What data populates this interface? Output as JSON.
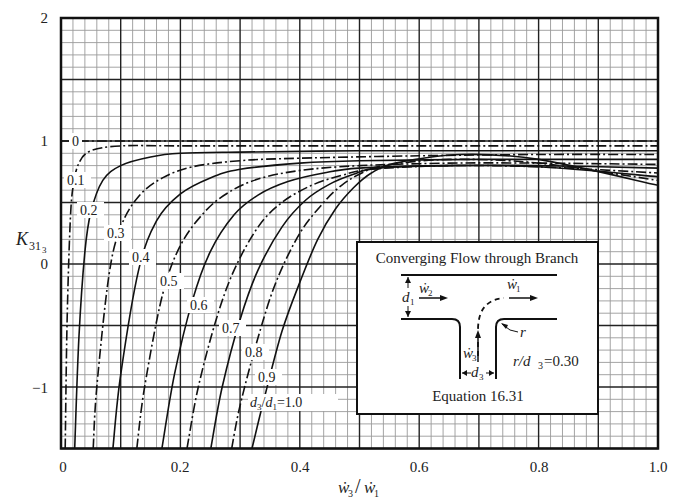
{
  "chart_data": {
    "type": "line",
    "title": "",
    "xlabel": "ẇ3 / ẇ1",
    "ylabel": "K31₃",
    "xlim": [
      0,
      1.0
    ],
    "ylim": [
      -1.5,
      2
    ],
    "grid": true,
    "xticks": [
      "0",
      "0.2",
      "0.4",
      "0.6",
      "0.8",
      "1.0"
    ],
    "yticks": [
      "2",
      "1",
      "0",
      "−1"
    ],
    "legend_position": "none (curves labeled inline)",
    "series": [
      {
        "name": "0",
        "style": "dash-dot",
        "x": [
          0.0,
          1.0
        ],
        "y": [
          1.0,
          1.0
        ]
      },
      {
        "name": "0.1",
        "style": "dash-dot",
        "x": [
          0.007,
          0.01,
          0.015,
          0.02,
          0.03,
          0.05,
          0.1,
          0.2,
          0.4,
          0.6,
          0.8,
          1.0
        ],
        "y": [
          -1.5,
          -0.5,
          0.3,
          0.62,
          0.82,
          0.92,
          0.96,
          0.96,
          0.96,
          0.96,
          0.96,
          0.96
        ]
      },
      {
        "name": "0.2",
        "style": "solid",
        "x": [
          0.023,
          0.03,
          0.04,
          0.05,
          0.07,
          0.1,
          0.15,
          0.2,
          0.3,
          0.5,
          0.7,
          1.0
        ],
        "y": [
          -1.5,
          -0.6,
          0.1,
          0.42,
          0.68,
          0.8,
          0.87,
          0.9,
          0.91,
          0.92,
          0.92,
          0.92
        ]
      },
      {
        "name": "0.3",
        "style": "dash-dot",
        "x": [
          0.054,
          0.06,
          0.08,
          0.1,
          0.13,
          0.17,
          0.22,
          0.3,
          0.4,
          0.6,
          0.8,
          1.0
        ],
        "y": [
          -1.5,
          -1.0,
          -0.1,
          0.3,
          0.55,
          0.7,
          0.79,
          0.84,
          0.86,
          0.88,
          0.89,
          0.89
        ]
      },
      {
        "name": "0.4",
        "style": "solid",
        "x": [
          0.087,
          0.1,
          0.13,
          0.16,
          0.2,
          0.25,
          0.3,
          0.4,
          0.5,
          0.7,
          0.85,
          1.0
        ],
        "y": [
          -1.5,
          -0.9,
          -0.05,
          0.35,
          0.57,
          0.7,
          0.77,
          0.82,
          0.84,
          0.85,
          0.85,
          0.85
        ]
      },
      {
        "name": "0.5",
        "style": "dash-dot",
        "x": [
          0.127,
          0.14,
          0.17,
          0.2,
          0.24,
          0.28,
          0.33,
          0.4,
          0.5,
          0.65,
          0.8,
          1.0
        ],
        "y": [
          -1.5,
          -1.0,
          -0.25,
          0.15,
          0.42,
          0.58,
          0.69,
          0.76,
          0.8,
          0.82,
          0.82,
          0.81
        ]
      },
      {
        "name": "0.6",
        "style": "solid",
        "x": [
          0.169,
          0.19,
          0.22,
          0.25,
          0.29,
          0.33,
          0.38,
          0.44,
          0.5,
          0.65,
          0.8,
          1.0
        ],
        "y": [
          -1.5,
          -0.9,
          -0.3,
          0.1,
          0.4,
          0.56,
          0.67,
          0.74,
          0.78,
          0.8,
          0.8,
          0.78
        ]
      },
      {
        "name": "0.7",
        "style": "dash-dot",
        "x": [
          0.211,
          0.23,
          0.26,
          0.29,
          0.33,
          0.37,
          0.42,
          0.47,
          0.52,
          0.65,
          0.8,
          1.0
        ],
        "y": [
          -1.5,
          -1.0,
          -0.45,
          -0.05,
          0.3,
          0.5,
          0.64,
          0.72,
          0.77,
          0.8,
          0.79,
          0.74
        ]
      },
      {
        "name": "0.8",
        "style": "solid",
        "x": [
          0.251,
          0.27,
          0.3,
          0.33,
          0.37,
          0.41,
          0.45,
          0.49,
          0.53,
          0.65,
          0.8,
          1.0
        ],
        "y": [
          -1.5,
          -1.0,
          -0.45,
          -0.05,
          0.3,
          0.52,
          0.65,
          0.73,
          0.78,
          0.8,
          0.79,
          0.71
        ]
      },
      {
        "name": "0.9",
        "style": "dash-dot",
        "x": [
          0.286,
          0.3,
          0.33,
          0.36,
          0.4,
          0.44,
          0.47,
          0.5,
          0.54,
          0.65,
          0.8,
          1.0
        ],
        "y": [
          -1.5,
          -1.15,
          -0.6,
          -0.15,
          0.25,
          0.5,
          0.64,
          0.73,
          0.8,
          0.85,
          0.82,
          0.68
        ]
      },
      {
        "name": "d3/d1=1.0",
        "style": "solid",
        "x": [
          0.32,
          0.34,
          0.37,
          0.4,
          0.43,
          0.46,
          0.49,
          0.52,
          0.56,
          0.67,
          0.8,
          1.0
        ],
        "y": [
          -1.5,
          -1.1,
          -0.55,
          -0.15,
          0.2,
          0.45,
          0.62,
          0.74,
          0.82,
          0.89,
          0.85,
          0.64
        ]
      }
    ],
    "annotations": [
      "Inset: Converging Flow through Branch",
      "r/d3 = 0.30",
      "Equation 16.31"
    ]
  },
  "axes": {
    "y_label_main": "K",
    "y_label_sub": "31",
    "y_label_subsub": "3",
    "x_label_num": "ẇ",
    "x_label_num_sub": "3",
    "x_label_slash": "/",
    "x_label_den": "ẇ",
    "x_label_den_sub": "1",
    "xticks": [
      "0",
      "0.2",
      "0.4",
      "0.6",
      "0.8",
      "1.0"
    ],
    "yticks": [
      "2",
      "1",
      "0",
      "−1"
    ]
  },
  "curve_labels": [
    "0",
    "0.1",
    "0.2",
    "0.3",
    "0.4",
    "0.5",
    "0.6",
    "0.7",
    "0.8",
    "0.9"
  ],
  "last_curve_label": {
    "d3": "d",
    "sub3": "3",
    "slash": "/",
    "d1": "d",
    "sub1": "1",
    "eq": "=1.0"
  },
  "inset": {
    "title": "Converging Flow through Branch",
    "w2": "ẇ",
    "w2_sub": "2",
    "w1": "ẇ",
    "w1_sub": "1",
    "w3": "ẇ",
    "w3_sub": "3",
    "d1": "d",
    "d1_sub": "1",
    "d3": "d",
    "d3_sub": "3",
    "r": "r",
    "ratio_r": "r/d",
    "ratio_sub": "3",
    "ratio_val": "=0.30",
    "equation": "Equation 16.31"
  }
}
